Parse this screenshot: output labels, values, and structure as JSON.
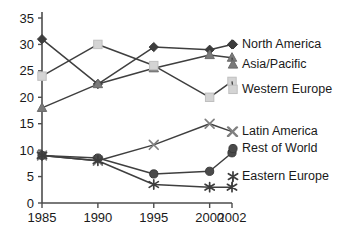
{
  "chart_data": {
    "type": "line",
    "title": "",
    "xlabel": "",
    "ylabel": "",
    "x": [
      1985,
      1990,
      1995,
      2000,
      2002
    ],
    "xtick_labels": [
      "1985",
      "1990",
      "1995",
      "2000",
      "2002"
    ],
    "ytick_labels": [
      "0",
      "5",
      "10",
      "15",
      "20",
      "25",
      "30",
      "35"
    ],
    "yticks": [
      0,
      5,
      10,
      15,
      20,
      25,
      30,
      35
    ],
    "ylim": [
      0,
      35
    ],
    "grid": false,
    "legend_position": "right-inline-labels",
    "series": [
      {
        "name": "North America",
        "values": [
          31,
          22.5,
          29.5,
          29,
          30
        ],
        "marker": "diamond",
        "color": "#3d3d3d",
        "label_y_value": 30
      },
      {
        "name": "Asia/Pacific",
        "values": [
          18,
          22.5,
          25.5,
          28,
          27.5
        ],
        "marker": "triangle",
        "color": "#7a7a7a",
        "label_y_value": 26.2
      },
      {
        "name": "Western Europe",
        "values": [
          24,
          30,
          26,
          20,
          23
        ],
        "marker": "square",
        "color": "#d4d4d4",
        "label_y_value": 21.5
      },
      {
        "name": "Latin America",
        "values": [
          9,
          8,
          11,
          15,
          13.5
        ],
        "marker": "cross",
        "color": "#808080",
        "label_y_value": 13.5
      },
      {
        "name": "Rest of World",
        "values": [
          9,
          8.5,
          5.5,
          6,
          9.5
        ],
        "marker": "circle",
        "color": "#4a4a4a",
        "label_y_value": 10.3
      },
      {
        "name": "Eastern Europe",
        "values": [
          9,
          8,
          3.5,
          3,
          3
        ],
        "marker": "asterisk",
        "color": "#3d3d3d",
        "label_y_value": 5.0
      }
    ]
  }
}
